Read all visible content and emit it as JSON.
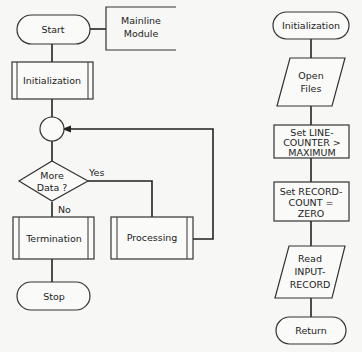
{
  "mainline": {
    "start": "Start",
    "module_note": [
      "Mainline",
      "Module"
    ],
    "initialization": "Initialization",
    "decision": [
      "More",
      "Data ?"
    ],
    "yes": "Yes",
    "no": "No",
    "termination": "Termination",
    "processing": "Processing",
    "stop": "Stop"
  },
  "init_module": {
    "entry": "Initialization",
    "open_files": [
      "Open",
      "Files"
    ],
    "set_line_counter": [
      "Set LINE-",
      "COUNTER >",
      "MAXIMUM"
    ],
    "set_record_count": [
      "Set RECORD-",
      "COUNT =",
      "ZERO"
    ],
    "read_input": [
      "Read",
      "INPUT-",
      "RECORD"
    ],
    "return": "Return"
  }
}
